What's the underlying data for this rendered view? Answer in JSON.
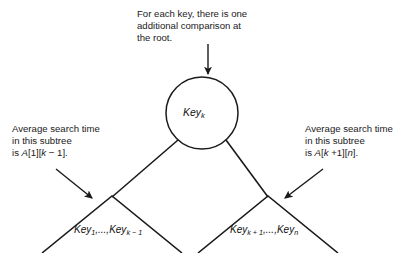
{
  "figure": {
    "background_color": "#ffffff",
    "stroke_color": "#1a1a1a",
    "text_color": "#1a1a1a"
  },
  "annotations": {
    "top": {
      "line1": "For each key, there is one",
      "line2": "additional comparison at",
      "line3": "the root."
    },
    "left": {
      "line1": "Average search time",
      "line2": "in this subtree",
      "line3_prefix": "is ",
      "line3_array": "A",
      "line3_index1": "[1][",
      "line3_var": "k",
      "line3_index2": " − 1]."
    },
    "right": {
      "line1": "Average search time",
      "line2": "in this subtree",
      "line3_prefix": "is ",
      "line3_array": "A",
      "line3_index1": "[",
      "line3_var": "k",
      "line3_index2": " +1][",
      "line3_var2": "n",
      "line3_index3": "]."
    }
  },
  "nodes": {
    "root": {
      "label_text": "Key",
      "label_sub": "k",
      "cx": 202,
      "cy": 113,
      "r": 36
    },
    "left_subtree": {
      "label_text_1": "Key",
      "label_sub_1": "1",
      "label_sep": ",...,",
      "label_text_2": "Key",
      "label_sub_2": "k − 1"
    },
    "right_subtree": {
      "label_text_1": "Key",
      "label_sub_1": "k + 1",
      "label_sep": ",...,",
      "label_text_2": "Key",
      "label_sub_2": "n"
    }
  }
}
